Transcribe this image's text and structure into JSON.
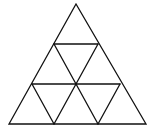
{
  "diagram": {
    "type": "subdivided-triangle",
    "rows": 3,
    "small_triangle_count": 9,
    "stroke_color": "#111111",
    "background": "#ffffff",
    "outer_triangle": {
      "apex": [
        76,
        4
      ],
      "base_left": [
        9,
        124
      ],
      "base_right": [
        146,
        124
      ]
    }
  }
}
